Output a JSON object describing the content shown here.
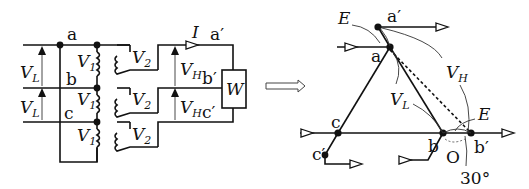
{
  "circuit": {
    "nodes": {
      "a": "a",
      "b": "b",
      "c": "c",
      "a_prime": "a′",
      "b_prime": "b′",
      "c_prime": "c′"
    },
    "line_voltage": {
      "symbol": "V",
      "sub": "L"
    },
    "primary_voltage": {
      "symbol": "V",
      "sub": "1"
    },
    "secondary_voltage": {
      "symbol": "V",
      "sub": "2"
    },
    "output_voltage": {
      "symbol": "V",
      "sub": "H"
    },
    "current": "I",
    "wattmeter": "W"
  },
  "transition_arrow": "⟹",
  "phasor": {
    "nodes": {
      "a": "a",
      "b": "b",
      "c": "c",
      "a_prime": "a′",
      "b_prime": "b′",
      "c_prime": "c′",
      "origin": "O"
    },
    "emf_top": "E",
    "emf_right": "E",
    "line_voltage": {
      "symbol": "V",
      "sub": "L"
    },
    "output_voltage": {
      "symbol": "V",
      "sub": "H"
    },
    "angle": "30°"
  }
}
